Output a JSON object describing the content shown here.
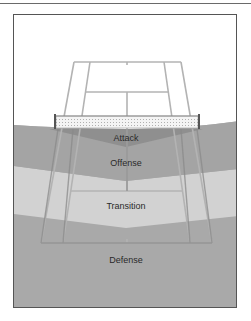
{
  "diagram": {
    "zones": [
      {
        "name": "attack",
        "label": "Attack",
        "color": "#8e8e8e"
      },
      {
        "name": "offense",
        "label": "Offense",
        "color": "#a3a3a3"
      },
      {
        "name": "transition",
        "label": "Transition",
        "color": "#cfcfcf"
      },
      {
        "name": "defense",
        "label": "Defense",
        "color": "#a9a9a9"
      }
    ],
    "court_line_color": "#bdbdbd",
    "net_color": "#777777"
  }
}
